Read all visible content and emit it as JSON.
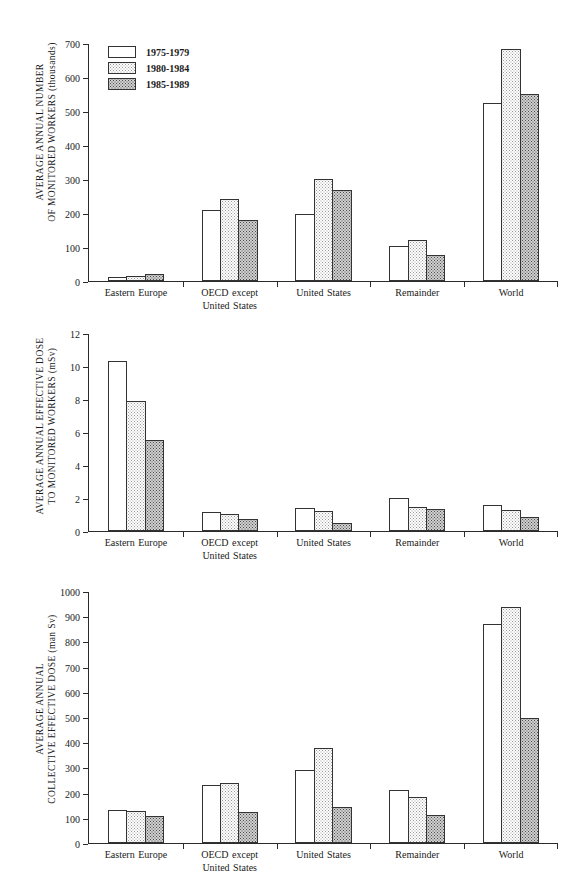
{
  "legend": {
    "position": "top-left-inside-panel-0",
    "entries": [
      {
        "label": "1975-1979",
        "swatch": "white-open-rectangle"
      },
      {
        "label": "1980-1984",
        "swatch": "light-stipple-rectangle"
      },
      {
        "label": "1985-1989",
        "swatch": "dark-stipple-rectangle"
      }
    ]
  },
  "colors": {
    "series_1975_1979": "#ffffff",
    "series_1980_1984": "#dcdcdc",
    "series_1985_1989": "#9a9a9a",
    "axis": "#2b2b2b",
    "bar_outline": "#333333",
    "background": "#ffffff"
  },
  "chart_data": [
    {
      "type": "bar",
      "title": "",
      "xlabel": "",
      "ylabel": "AVERAGE ANNUAL NUMBER OF MONITORED WORKERS (thousands)",
      "ylabel_line1": "AVERAGE ANNUAL NUMBER",
      "ylabel_line2": "OF MONITORED WORKERS  (thousands)",
      "ylim": [
        0,
        700
      ],
      "yticks": [
        0,
        100,
        200,
        300,
        400,
        500,
        600,
        700
      ],
      "ytick_labels": [
        "0",
        "100",
        "200",
        "300",
        "400",
        "500",
        "600",
        "700"
      ],
      "grid": false,
      "legend_position": "upper left",
      "categories": [
        "Eastern Europe",
        "OECD except United States",
        "United States",
        "Remainder",
        "World"
      ],
      "category_lines": [
        [
          "Eastern  Europe",
          ""
        ],
        [
          "OECD  except",
          "United  States"
        ],
        [
          "United  States",
          ""
        ],
        [
          "Remainder",
          ""
        ],
        [
          "World",
          ""
        ]
      ],
      "series": [
        {
          "name": "1975-1979",
          "values": [
            13,
            208,
            198,
            102,
            523
          ]
        },
        {
          "name": "1980-1984",
          "values": [
            16,
            240,
            300,
            122,
            683
          ]
        },
        {
          "name": "1985-1989",
          "values": [
            20,
            180,
            268,
            77,
            550
          ]
        }
      ]
    },
    {
      "type": "bar",
      "title": "",
      "xlabel": "",
      "ylabel": "AVERAGE ANNUAL EFFECTIVE DOSE TO MONITORED WORKERS (mSv)",
      "ylabel_line1": "AVERAGE ANNUAL EFFECTIVE DOSE",
      "ylabel_line2": "TO MONITORED WORKERS  (mSv)",
      "ylim": [
        0,
        12
      ],
      "yticks": [
        0,
        2,
        4,
        6,
        8,
        10,
        12
      ],
      "ytick_labels": [
        "0",
        "2",
        "4",
        "6",
        "8",
        "10",
        "12"
      ],
      "grid": false,
      "legend_position": "none",
      "categories": [
        "Eastern Europe",
        "OECD except United States",
        "United States",
        "Remainder",
        "World"
      ],
      "category_lines": [
        [
          "Eastern  Europe",
          ""
        ],
        [
          "OECD  except",
          "United  States"
        ],
        [
          "United  States",
          ""
        ],
        [
          "Remainder",
          ""
        ],
        [
          "World",
          ""
        ]
      ],
      "series": [
        {
          "name": "1975-1979",
          "values": [
            10.3,
            1.15,
            1.4,
            2.0,
            1.55
          ]
        },
        {
          "name": "1980-1984",
          "values": [
            7.85,
            1.05,
            1.2,
            1.45,
            1.25
          ]
        },
        {
          "name": "1985-1989",
          "values": [
            5.5,
            0.7,
            0.5,
            1.35,
            0.85
          ]
        }
      ]
    },
    {
      "type": "bar",
      "title": "",
      "xlabel": "",
      "ylabel": "AVERAGE ANNUAL COLLECTIVE EFFECTIVE DOSE (man Sv)",
      "ylabel_line1": "AVERAGE ANNUAL",
      "ylabel_line2": "COLLECTIVE EFFECTIVE DOSE  (man Sv)",
      "ylim": [
        0,
        1000
      ],
      "yticks": [
        0,
        100,
        200,
        300,
        400,
        500,
        600,
        700,
        800,
        900,
        1000
      ],
      "ytick_labels": [
        "0",
        "100",
        "200",
        "300",
        "400",
        "500",
        "600",
        "700",
        "800",
        "900",
        "1000"
      ],
      "grid": false,
      "legend_position": "none",
      "categories": [
        "Eastern Europe",
        "OECD except United States",
        "United States",
        "Remainder",
        "World"
      ],
      "category_lines": [
        [
          "Eastern  Europe",
          ""
        ],
        [
          "OECD  except",
          "United  States"
        ],
        [
          "United  States",
          ""
        ],
        [
          "Remainder",
          ""
        ],
        [
          "World",
          ""
        ]
      ],
      "series": [
        {
          "name": "1975-1979",
          "values": [
            130,
            232,
            288,
            211,
            870
          ]
        },
        {
          "name": "1980-1984",
          "values": [
            126,
            238,
            377,
            184,
            937
          ]
        },
        {
          "name": "1985-1989",
          "values": [
            107,
            122,
            143,
            110,
            497
          ]
        }
      ]
    }
  ]
}
